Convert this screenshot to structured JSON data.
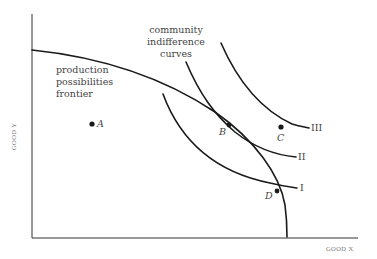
{
  "diagram": {
    "type": "economics-graph",
    "axes": {
      "x_label": "GOOD X",
      "y_label": "GOOD Y"
    },
    "curves": [
      {
        "id": "ppf",
        "name": "production possibilities frontier",
        "label_lines": [
          "production",
          "possibilities",
          "frontier"
        ]
      },
      {
        "id": "ic1",
        "name": "community indifference curve I",
        "label": "I"
      },
      {
        "id": "ic2",
        "name": "community indifference curve II",
        "label": "II"
      },
      {
        "id": "ic3",
        "name": "community indifference curve III",
        "label": "III"
      }
    ],
    "curves_group_label": [
      "community",
      "indifference",
      "curves"
    ],
    "points": [
      {
        "id": "A",
        "label": "A",
        "description": "inside frontier"
      },
      {
        "id": "B",
        "label": "B",
        "description": "tangency of frontier and curve II"
      },
      {
        "id": "C",
        "label": "C",
        "description": "beyond frontier"
      },
      {
        "id": "D",
        "label": "D",
        "description": "on frontier, intersecting curve I"
      }
    ],
    "colors": {
      "line": "#1a1a1a",
      "text": "#444444",
      "axis_text": "#777777"
    }
  }
}
